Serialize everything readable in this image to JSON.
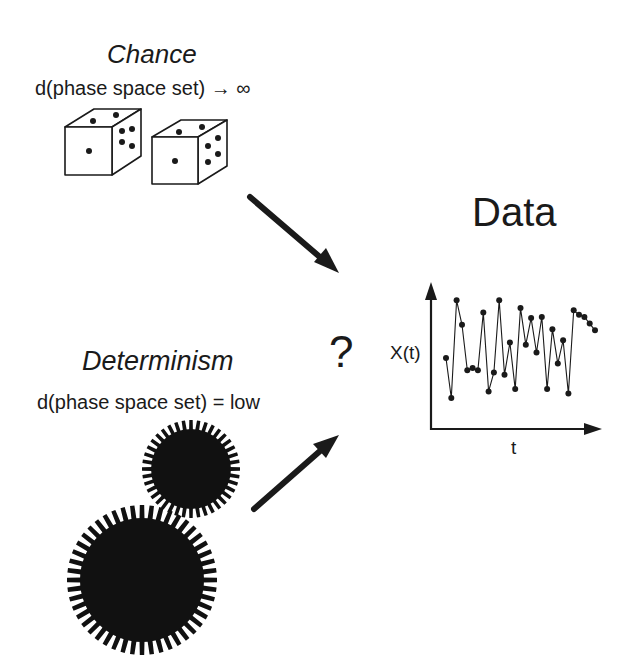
{
  "chance": {
    "title": "Chance",
    "subtitle": "d(phase space set)  →  ∞"
  },
  "determinism": {
    "title": "Determinism",
    "subtitle": "d(phase space set) =  low"
  },
  "center": {
    "question": "?"
  },
  "data_panel": {
    "title": "Data",
    "y_label": "X(t)",
    "x_label": "t"
  },
  "icons": [
    "dice-icon",
    "gear-icon",
    "arrow-icon"
  ],
  "colors": {
    "ink": "#1a1a1a",
    "background": "#ffffff"
  },
  "chart_data": {
    "type": "line",
    "title": "Data",
    "xlabel": "t",
    "ylabel": "X(t)",
    "grid": false,
    "markers": true,
    "note": "Schematic irregular time series; y values in arbitrary units 0-100 estimated from pixel positions",
    "x": [
      1,
      2,
      3,
      4,
      5,
      6,
      7,
      8,
      9,
      10,
      11,
      12,
      13,
      14,
      15,
      16,
      17,
      18,
      19,
      20,
      21,
      22,
      23,
      24,
      25,
      26,
      27,
      28,
      29
    ],
    "values": [
      45,
      9,
      97,
      75,
      34,
      36,
      34,
      86,
      15,
      32,
      97,
      30,
      59,
      17,
      90,
      57,
      81,
      50,
      82,
      17,
      71,
      40,
      61,
      13,
      88,
      84,
      82,
      76,
      70
    ]
  }
}
